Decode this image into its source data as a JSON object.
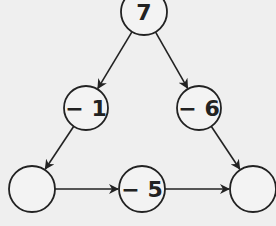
{
  "diagram": {
    "type": "number-triangle",
    "nodes": [
      {
        "id": "top",
        "label": "7",
        "cx": 144,
        "cy": 12,
        "r": 23
      },
      {
        "id": "left-mid",
        "label": "− 1",
        "cx": 86,
        "cy": 108,
        "r": 22
      },
      {
        "id": "right-mid",
        "label": "− 6",
        "cx": 199,
        "cy": 108,
        "r": 22
      },
      {
        "id": "bottom-left",
        "label": "",
        "cx": 32,
        "cy": 189,
        "r": 23
      },
      {
        "id": "bottom-mid",
        "label": "− 5",
        "cx": 142,
        "cy": 189,
        "r": 23
      },
      {
        "id": "bottom-right",
        "label": "",
        "cx": 253,
        "cy": 189,
        "r": 23
      }
    ],
    "edges": [
      {
        "from": "top",
        "to": "left-mid"
      },
      {
        "from": "top",
        "to": "right-mid"
      },
      {
        "from": "left-mid",
        "to": "bottom-left"
      },
      {
        "from": "right-mid",
        "to": "bottom-right"
      },
      {
        "from": "bottom-left",
        "to": "bottom-mid"
      },
      {
        "from": "bottom-mid",
        "to": "bottom-right"
      }
    ],
    "colors": {
      "stroke": "#222222",
      "background": "#efefef",
      "fill": "#f3f3f3"
    }
  }
}
